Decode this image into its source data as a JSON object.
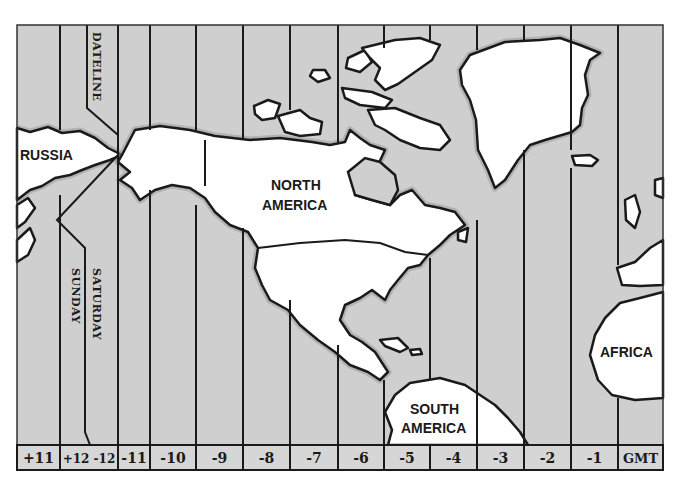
{
  "map": {
    "title": "Time Zones of North America",
    "colors": {
      "sea": "#cfcfcf",
      "land": "#ffffff",
      "outline": "#1a1a1a",
      "label_row": "#d6d6d6"
    },
    "zones": [
      {
        "label": "+11",
        "x0": 17,
        "x1": 60
      },
      {
        "label": "+12 -12",
        "x0": 60,
        "x1": 118
      },
      {
        "label": "-11",
        "x0": 118,
        "x1": 150
      },
      {
        "label": "-10",
        "x0": 150,
        "x1": 196
      },
      {
        "label": "-9",
        "x0": 196,
        "x1": 243
      },
      {
        "label": "-8",
        "x0": 243,
        "x1": 290
      },
      {
        "label": "-7",
        "x0": 290,
        "x1": 338
      },
      {
        "label": "-6",
        "x0": 338,
        "x1": 384
      },
      {
        "label": "-5",
        "x0": 384,
        "x1": 430
      },
      {
        "label": "-4",
        "x0": 430,
        "x1": 477
      },
      {
        "label": "-3",
        "x0": 477,
        "x1": 524
      },
      {
        "label": "-2",
        "x0": 524,
        "x1": 571
      },
      {
        "label": "-1",
        "x0": 571,
        "x1": 618
      },
      {
        "label": "GMT",
        "x0": 618,
        "x1": 663
      }
    ],
    "dateline": {
      "label": "DATELINE"
    },
    "day_labels": {
      "west": "SUNDAY",
      "east": "SATURDAY"
    },
    "continents": {
      "russia": "RUSSIA",
      "north_america_line1": "NORTH",
      "north_america_line2": "AMERICA",
      "south_america_line1": "SOUTH",
      "south_america_line2": "AMERICA",
      "africa": "AFRICA"
    }
  }
}
